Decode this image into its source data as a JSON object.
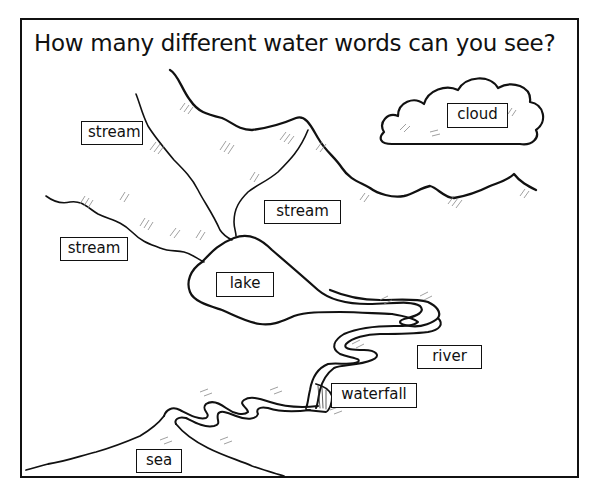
{
  "title": "How many different water words can you see?",
  "labels": {
    "cloud": "cloud",
    "stream_top_left": "stream",
    "stream_middle": "stream",
    "stream_left": "stream",
    "lake": "lake",
    "river": "river",
    "waterfall": "waterfall",
    "sea": "sea"
  },
  "colors": {
    "ink": "#111111",
    "background": "#ffffff",
    "hatching": "#888888"
  }
}
